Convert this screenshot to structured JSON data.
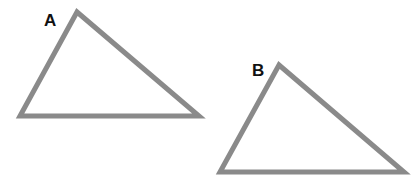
{
  "diagram": {
    "stroke_color": "#8a8a8a",
    "triangles": [
      {
        "label": "A",
        "points": "77,12 20,116 199,116"
      },
      {
        "label": "B",
        "points": "279,65 220,172 404,172"
      }
    ]
  }
}
